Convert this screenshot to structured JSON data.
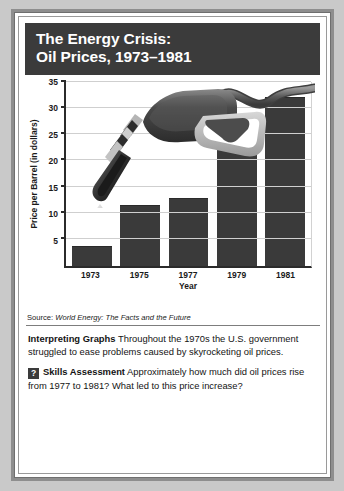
{
  "figure": {
    "title_line1": "The Energy Crisis:",
    "title_line2": "Oil Prices, 1973–1981",
    "source_prefix": "Source: ",
    "source_title": "World Energy: The Facts and the Future",
    "nozzle_icon": "gas-pump-nozzle-icon",
    "drip_icon": "oil-drip-icon"
  },
  "chart_data": {
    "type": "bar",
    "title": "The Energy Crisis: Oil Prices, 1973–1981",
    "categories": [
      "1973",
      "1975",
      "1977",
      "1979",
      "1981"
    ],
    "values": [
      3.7,
      11.5,
      12.8,
      24.1,
      32.1
    ],
    "xlabel": "Year",
    "ylabel": "Price per Barrel (in dollars)",
    "ylim": [
      0,
      35
    ],
    "yticks": [
      5,
      10,
      15,
      20,
      25,
      30,
      35
    ],
    "ytick_labels": [
      "5",
      "10",
      "15",
      "20",
      "25",
      "30",
      "35"
    ],
    "grid": true,
    "legend": "none",
    "bar_color": "#3a3a3a",
    "source": "World Energy: The Facts and the Future"
  },
  "notes": {
    "interpreting_label": "Interpreting Graphs",
    "interpreting_text": "  Throughout the 1970s the U.S. government struggled to ease problems caused by skyrocketing oil prices.",
    "badge_glyph": "?",
    "skills_label": "Skills Assessment",
    "skills_text": "  Approximately how much did oil prices rise from 1977 to 1981? What led to this price increase?"
  }
}
